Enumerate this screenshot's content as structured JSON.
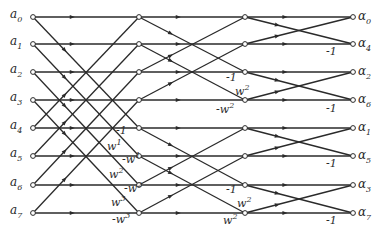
{
  "diagram": {
    "type": "fft-butterfly",
    "stroke_color": "#2a2a2a",
    "background": "#ffffff",
    "rows_y": [
      17,
      44,
      72,
      100,
      128,
      156,
      185,
      213
    ],
    "columns_x": {
      "input": 33,
      "stage1": 139,
      "stage2": 245,
      "output": 353
    },
    "inputs": [
      "a0",
      "a1",
      "a2",
      "a3",
      "a4",
      "a5",
      "a6",
      "a7"
    ],
    "input_labels": [
      {
        "base": "a",
        "sub": "0"
      },
      {
        "base": "a",
        "sub": "1"
      },
      {
        "base": "a",
        "sub": "2"
      },
      {
        "base": "a",
        "sub": "3"
      },
      {
        "base": "a",
        "sub": "4"
      },
      {
        "base": "a",
        "sub": "5"
      },
      {
        "base": "a",
        "sub": "6"
      },
      {
        "base": "a",
        "sub": "7"
      }
    ],
    "output_labels": [
      {
        "base": "α",
        "sub": "0"
      },
      {
        "base": "α",
        "sub": "4"
      },
      {
        "base": "α",
        "sub": "2"
      },
      {
        "base": "α",
        "sub": "6"
      },
      {
        "base": "α",
        "sub": "1"
      },
      {
        "base": "α",
        "sub": "5"
      },
      {
        "base": "α",
        "sub": "3"
      },
      {
        "base": "α",
        "sub": "7"
      }
    ],
    "stage1_span": 4,
    "stage2_span": 2,
    "stage3_span": 1,
    "stage1_weights": [
      {
        "row": 4,
        "text": "-1",
        "sup": "",
        "x": 116,
        "y": 134
      },
      {
        "row": 4,
        "text": "w",
        "sup": "1",
        "x": 107,
        "y": 150
      },
      {
        "row": 5,
        "text": "-w",
        "sup": "1",
        "x": 122,
        "y": 163
      },
      {
        "row": 5,
        "text": "w",
        "sup": "2",
        "x": 109,
        "y": 178
      },
      {
        "row": 6,
        "text": "-w",
        "sup": "2",
        "x": 124,
        "y": 192
      },
      {
        "row": 6,
        "text": "w",
        "sup": "3",
        "x": 111,
        "y": 206
      },
      {
        "row": 7,
        "text": "-w",
        "sup": "3",
        "x": 112,
        "y": 223
      }
    ],
    "stage2_weights": [
      {
        "text": "-1",
        "sup": "",
        "x": 226,
        "y": 81
      },
      {
        "text": "w",
        "sup": "2",
        "x": 235,
        "y": 95
      },
      {
        "text": "-w",
        "sup": "2",
        "x": 216,
        "y": 113
      },
      {
        "text": "-1",
        "sup": "",
        "x": 226,
        "y": 193
      },
      {
        "text": "w",
        "sup": "2",
        "x": 237,
        "y": 207
      },
      {
        "text": "w",
        "sup": "2",
        "x": 223,
        "y": 224
      }
    ],
    "stage3_weights": [
      {
        "text": "-1",
        "sup": "",
        "x": 326,
        "y": 55
      },
      {
        "text": "-1",
        "sup": "",
        "x": 326,
        "y": 112
      },
      {
        "text": "-1",
        "sup": "",
        "x": 326,
        "y": 167
      },
      {
        "text": "-1",
        "sup": "",
        "x": 326,
        "y": 224
      }
    ]
  }
}
